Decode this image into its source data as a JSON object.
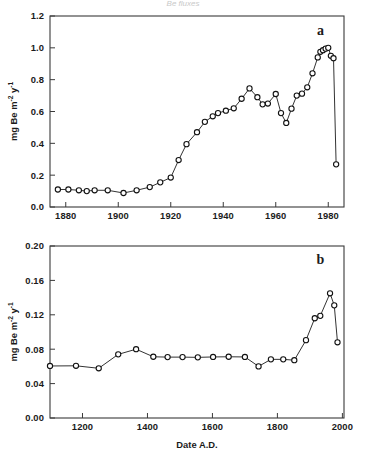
{
  "figure": {
    "background_color": "#ffffff",
    "line_color": "#111111",
    "marker_fill": "#ffffff",
    "axis_color": "#3a3a3a",
    "clipped_header_text": "Be fluxes"
  },
  "chart_data": [
    {
      "type": "line",
      "panel_label": "a",
      "title": "",
      "xlabel": "",
      "ylabel": "mg Be m-2 y-1",
      "ylabel_parts": {
        "lead": "mg Be m",
        "sup1": "-2",
        "mid": " y",
        "sup2": "-1"
      },
      "xlim": [
        1874,
        1986
      ],
      "ylim": [
        0.0,
        1.2
      ],
      "xticks": [
        1880,
        1900,
        1920,
        1940,
        1960,
        1980
      ],
      "xtick_labels": [
        "1880",
        "1900",
        "1920",
        "1940",
        "1960",
        "1980"
      ],
      "yticks": [
        0.0,
        0.2,
        0.4,
        0.6,
        0.8,
        1.0,
        1.2
      ],
      "ytick_labels": [
        "0.0",
        "0.2",
        "0.4",
        "0.6",
        "0.8",
        "1.0",
        "1.2"
      ],
      "grid": false,
      "legend": false,
      "marker": "open-circle",
      "x": [
        1877,
        1881,
        1885,
        1888,
        1891,
        1896,
        1902,
        1907,
        1912,
        1916,
        1920,
        1923,
        1926,
        1930,
        1933,
        1936,
        1938,
        1941,
        1944,
        1947,
        1950,
        1953,
        1955,
        1957,
        1960,
        1962,
        1964,
        1966,
        1968,
        1970,
        1972,
        1974,
        1976,
        1977,
        1978,
        1979,
        1980,
        1981,
        1982,
        1983
      ],
      "y": [
        0.11,
        0.11,
        0.105,
        0.1,
        0.105,
        0.105,
        0.088,
        0.105,
        0.125,
        0.155,
        0.185,
        0.295,
        0.395,
        0.47,
        0.535,
        0.57,
        0.59,
        0.605,
        0.62,
        0.68,
        0.745,
        0.69,
        0.645,
        0.65,
        0.71,
        0.59,
        0.528,
        0.618,
        0.7,
        0.712,
        0.752,
        0.84,
        0.94,
        0.975,
        0.985,
        0.995,
        1.0,
        0.95,
        0.935,
        0.268
      ],
      "annotations": [
        {
          "text": "a",
          "x_frac": 0.92,
          "y_frac": 0.93
        }
      ]
    },
    {
      "type": "line",
      "panel_label": "b",
      "title": "",
      "xlabel": "Date A.D.",
      "ylabel": "mg Be m-2 y-1",
      "ylabel_parts": {
        "lead": "mg Be m",
        "sup1": "-2",
        "mid": " y",
        "sup2": "-1"
      },
      "xlim": [
        1100,
        2005
      ],
      "ylim": [
        0.0,
        0.2
      ],
      "xticks": [
        1200,
        1400,
        1600,
        1800,
        2000
      ],
      "xtick_labels": [
        "1200",
        "1400",
        "1600",
        "1800",
        "2000"
      ],
      "yticks": [
        0.0,
        0.04,
        0.08,
        0.12,
        0.16,
        0.2
      ],
      "ytick_labels": [
        "0.00",
        "0.04",
        "0.08",
        "0.12",
        "0.16",
        "0.20"
      ],
      "grid": false,
      "legend": false,
      "marker": "open-circle",
      "x": [
        1100,
        1180,
        1250,
        1310,
        1365,
        1418,
        1462,
        1508,
        1555,
        1602,
        1650,
        1700,
        1742,
        1780,
        1818,
        1852,
        1888,
        1915,
        1932,
        1962,
        1975,
        1985
      ],
      "y": [
        0.0605,
        0.0607,
        0.0578,
        0.074,
        0.08,
        0.0712,
        0.0708,
        0.0708,
        0.0705,
        0.071,
        0.0712,
        0.071,
        0.06,
        0.0682,
        0.0682,
        0.0672,
        0.0905,
        0.116,
        0.1188,
        0.145,
        0.131,
        0.088
      ],
      "annotations": [
        {
          "text": "b",
          "x_frac": 0.92,
          "y_frac": 0.93
        }
      ]
    }
  ]
}
